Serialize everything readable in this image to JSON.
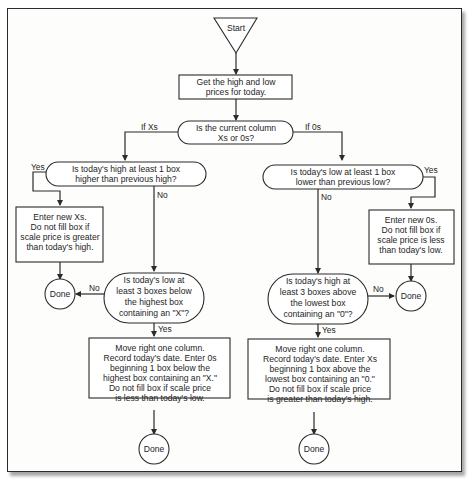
{
  "diagram": {
    "type": "flowchart",
    "start": {
      "label": "Start"
    },
    "get_prices": {
      "lines": [
        "Get the high and low",
        "prices for today."
      ]
    },
    "column_decision": {
      "lines": [
        "Is the current column",
        "Xs  or 0s?"
      ],
      "left_label": "If Xs",
      "right_label": "If 0s"
    },
    "x_branch": {
      "high_decision": {
        "lines": [
          "Is today's high at least 1 box",
          "higher than previous high?"
        ],
        "yes_label": "Yes",
        "no_label": "No"
      },
      "enter_xs": {
        "lines": [
          "Enter new Xs.",
          "Do not fill box if",
          "scale price is greater",
          "than today's high."
        ]
      },
      "done_1": {
        "label": "Done"
      },
      "reversal_decision": {
        "lines": [
          "Is today's low at",
          "least 3 boxes below",
          "the highest box",
          "containing an \"X\"?"
        ],
        "no_label": "No",
        "yes_label": "Yes"
      },
      "reversal_action": {
        "lines": [
          "Move right one column.",
          "Record today's date. Enter 0s",
          "beginning 1 box below the",
          "highest box containing an \"X.\"",
          "Do not fill box if scale price",
          "is less than today's low."
        ]
      },
      "done_2": {
        "label": "Done"
      }
    },
    "o_branch": {
      "low_decision": {
        "lines": [
          "Is today's low at least 1 box",
          "lower than previous low?"
        ],
        "yes_label": "Yes",
        "no_label": "No"
      },
      "enter_os": {
        "lines": [
          "Enter new 0s.",
          "Do not fill box if",
          "scale price is less",
          "than today's low."
        ]
      },
      "done_1": {
        "label": "Done"
      },
      "reversal_decision": {
        "lines": [
          "Is today's high at",
          "least 3 boxes above",
          "the lowest box",
          "containing an \"0\"?"
        ],
        "no_label": "No",
        "yes_label": "Yes"
      },
      "reversal_action": {
        "lines": [
          "Move right one column.",
          "Record today's date. Enter Xs",
          "beginning 1 box above the",
          "lowest box containing an \"0.\"",
          "Do not fill box if scale price",
          "is greater than today's high."
        ]
      },
      "done_2": {
        "label": "Done"
      }
    }
  }
}
